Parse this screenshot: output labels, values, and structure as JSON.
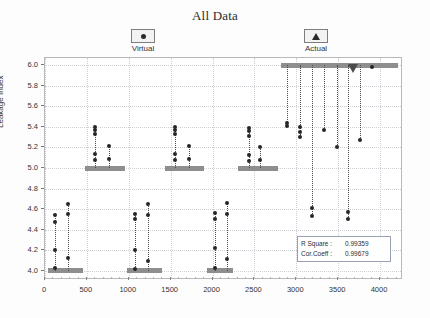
{
  "chart": {
    "title": "All Data",
    "legend": [
      {
        "label": "Virtual",
        "icon": "dot-marker-icon"
      },
      {
        "label": "Actual",
        "icon": "triangle-marker-icon"
      }
    ],
    "stats": [
      {
        "key": "R Square :",
        "value": "0.99359"
      },
      {
        "key": "Cor.Coeff :",
        "value": "0.99679"
      }
    ]
  },
  "chart_data": {
    "type": "scatter",
    "title": "All Data",
    "xlabel": "",
    "ylabel": "Leakage Index",
    "xlim": [
      0,
      4250
    ],
    "ylim": [
      3.93,
      6.07
    ],
    "grid": true,
    "legend_position": "top",
    "xticks": [
      0,
      500,
      1000,
      1500,
      2000,
      2500,
      3000,
      3500,
      4000
    ],
    "yticks": [
      4.0,
      4.2,
      4.4,
      4.6,
      4.8,
      5.0,
      5.2,
      5.4,
      5.6,
      5.8,
      6.0
    ],
    "series": [
      {
        "name": "Actual",
        "type": "step-bars",
        "color": "#8e8e8e",
        "segments": [
          {
            "x_start": 30,
            "x_end": 450,
            "y": 4.0
          },
          {
            "x_start": 480,
            "x_end": 950,
            "y": 5.0
          },
          {
            "x_start": 980,
            "x_end": 1400,
            "y": 4.0
          },
          {
            "x_start": 1430,
            "x_end": 1900,
            "y": 5.0
          },
          {
            "x_start": 1930,
            "x_end": 2250,
            "y": 4.0
          },
          {
            "x_start": 2300,
            "x_end": 2780,
            "y": 5.0
          },
          {
            "x_start": 2820,
            "x_end": 4220,
            "y": 6.0
          }
        ],
        "markers": [
          {
            "x": 3680,
            "y": 6.0,
            "shape": "triangle"
          }
        ]
      },
      {
        "name": "Virtual",
        "type": "stem-scatter",
        "color": "#262626",
        "stems": [
          {
            "x": 120,
            "base": 4.0,
            "points": [
              4.03,
              4.2,
              4.47,
              4.54
            ]
          },
          {
            "x": 280,
            "base": 4.0,
            "points": [
              4.12,
              4.55,
              4.65
            ]
          },
          {
            "x": 600,
            "base": 5.0,
            "points": [
              5.08,
              5.14,
              5.33,
              5.37,
              5.4
            ]
          },
          {
            "x": 760,
            "base": 5.0,
            "points": [
              5.09,
              5.21
            ]
          },
          {
            "x": 1080,
            "base": 4.0,
            "points": [
              4.02,
              4.2,
              4.5,
              4.55
            ]
          },
          {
            "x": 1230,
            "base": 4.0,
            "points": [
              4.1,
              4.54,
              4.65
            ]
          },
          {
            "x": 1550,
            "base": 5.0,
            "points": [
              5.08,
              5.14,
              5.33,
              5.37,
              5.4
            ]
          },
          {
            "x": 1720,
            "base": 5.0,
            "points": [
              5.09,
              5.21
            ]
          },
          {
            "x": 2030,
            "base": 4.0,
            "points": [
              4.03,
              4.22,
              4.5,
              4.56
            ]
          },
          {
            "x": 2170,
            "base": 4.0,
            "points": [
              4.11,
              4.55,
              4.66
            ]
          },
          {
            "x": 2430,
            "base": 5.0,
            "points": [
              5.07,
              5.13,
              5.31,
              5.36,
              5.39
            ]
          },
          {
            "x": 2570,
            "base": 5.0,
            "points": [
              5.08,
              5.2
            ]
          },
          {
            "x": 2890,
            "base": 6.0,
            "points": [
              5.41,
              5.44
            ]
          },
          {
            "x": 3050,
            "base": 6.0,
            "points": [
              5.3,
              5.35,
              5.4
            ]
          },
          {
            "x": 3190,
            "base": 6.0,
            "points": [
              4.53,
              4.61
            ]
          },
          {
            "x": 3330,
            "base": 6.0,
            "points": [
              5.37
            ]
          },
          {
            "x": 3480,
            "base": 6.0,
            "points": [
              5.2
            ]
          },
          {
            "x": 3620,
            "base": 6.0,
            "points": [
              4.5,
              4.57
            ]
          },
          {
            "x": 3760,
            "base": 6.0,
            "points": [
              5.27
            ]
          },
          {
            "x": 3900,
            "base": 6.0,
            "points": [
              5.98
            ]
          }
        ]
      }
    ]
  }
}
